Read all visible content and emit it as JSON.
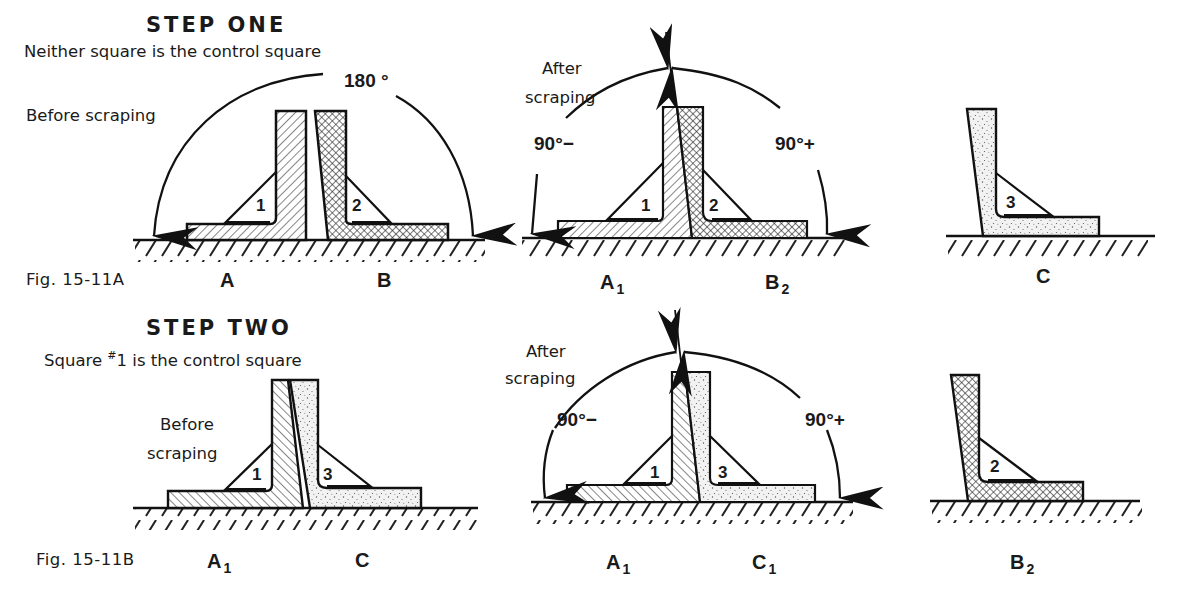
{
  "step_one": {
    "title": "STEP ONE",
    "subtitle": "Neither square is the control square",
    "figure_label": "Fig. 15-11A",
    "before": {
      "label": "Before scraping",
      "angle": "180 °",
      "squares": [
        {
          "letter": "A",
          "sub": "",
          "number": "1",
          "fill": "diagonal-hatch"
        },
        {
          "letter": "B",
          "sub": "",
          "number": "2",
          "fill": "crosshatch"
        }
      ]
    },
    "after": {
      "label_line1": "After",
      "label_line2": "scraping",
      "angle_left": "90°−",
      "angle_right": "90°+",
      "squares": [
        {
          "letter": "A",
          "sub": "1",
          "number": "1",
          "fill": "diagonal-hatch"
        },
        {
          "letter": "B",
          "sub": "2",
          "number": "2",
          "fill": "crosshatch"
        }
      ]
    },
    "third": {
      "letter": "C",
      "sub": "",
      "number": "3",
      "fill": "stipple"
    }
  },
  "step_two": {
    "title": "STEP TWO",
    "subtitle_prefix": "Square ",
    "subtitle_sup": "#",
    "subtitle_rest": "1 is the control square",
    "figure_label": "Fig. 15-11B",
    "before": {
      "label_line1": "Before",
      "label_line2": "scraping",
      "squares": [
        {
          "letter": "A",
          "sub": "1",
          "number": "1",
          "fill": "diagonal-hatch"
        },
        {
          "letter": "C",
          "sub": "",
          "number": "3",
          "fill": "stipple"
        }
      ]
    },
    "after": {
      "label_line1": "After",
      "label_line2": "scraping",
      "angle_left": "90°−",
      "angle_right": "90°+",
      "squares": [
        {
          "letter": "A",
          "sub": "1",
          "number": "1",
          "fill": "diagonal-hatch"
        },
        {
          "letter": "C",
          "sub": "1",
          "number": "3",
          "fill": "stipple"
        }
      ]
    },
    "third": {
      "letter": "B",
      "sub": "2",
      "number": "2",
      "fill": "crosshatch"
    }
  },
  "colors": {
    "ink": "#1a1a1a",
    "paper": "#ffffff"
  }
}
